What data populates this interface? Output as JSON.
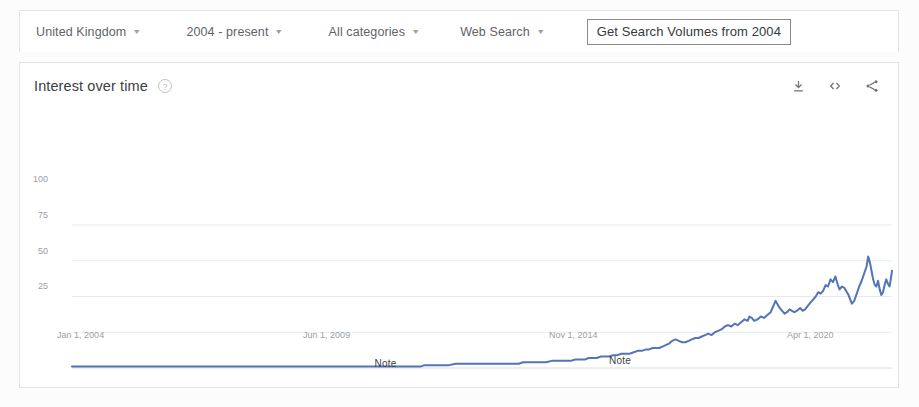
{
  "toolbar": {
    "filters": [
      {
        "label": "United Kingdom",
        "name": "region-selector"
      },
      {
        "label": "2004 - present",
        "name": "time-range-selector"
      },
      {
        "label": "All categories",
        "name": "category-selector"
      },
      {
        "label": "Web Search",
        "name": "search-type-selector"
      }
    ],
    "caret": "▾",
    "cta_label": "Get Search Volumes from 2004"
  },
  "card": {
    "title": "Interest over time",
    "help_glyph": "?",
    "actions": [
      {
        "name": "download-icon",
        "label": "Download"
      },
      {
        "name": "embed-code-icon",
        "label": "Embed"
      },
      {
        "name": "share-icon",
        "label": "Share"
      }
    ]
  },
  "annotations": [
    {
      "label": "Note",
      "x_pct": 38.6,
      "y_px": 249
    },
    {
      "label": "Note",
      "x_pct": 67.2,
      "y_px": 246
    }
  ],
  "colors": {
    "line": "#5374b6",
    "grid": "#e8eaed",
    "axis_text": "#9aa0a6",
    "card_border": "#e4e4e4"
  },
  "chart_data": {
    "type": "line",
    "title": "Interest over time",
    "xlabel": "",
    "ylabel": "",
    "ylim": [
      0,
      100
    ],
    "yticks": [
      100,
      75,
      50,
      25
    ],
    "grid": true,
    "legend": "none",
    "xtick_labels": [
      "Jan 1, 2004",
      "Jun 1, 2009",
      "Nov 1, 2014",
      "Apr 1, 2020"
    ],
    "xtick_pcts": [
      0.5,
      30.5,
      60.5,
      89.5
    ],
    "series": [
      {
        "name": "Interest over time",
        "color": "#5374b6",
        "points": [
          [
            0.0,
            1
          ],
          [
            1.2,
            1
          ],
          [
            2.5,
            1
          ],
          [
            3.8,
            1
          ],
          [
            5.0,
            1
          ],
          [
            6.3,
            1
          ],
          [
            7.5,
            1
          ],
          [
            8.8,
            1
          ],
          [
            10.0,
            1
          ],
          [
            11.3,
            1
          ],
          [
            12.5,
            1
          ],
          [
            13.8,
            1
          ],
          [
            15.0,
            1
          ],
          [
            16.3,
            1
          ],
          [
            17.5,
            1
          ],
          [
            18.8,
            1
          ],
          [
            20.0,
            1
          ],
          [
            21.3,
            1
          ],
          [
            22.5,
            1
          ],
          [
            23.8,
            1
          ],
          [
            25.0,
            1
          ],
          [
            26.3,
            1
          ],
          [
            27.5,
            1
          ],
          [
            28.8,
            1
          ],
          [
            30.0,
            1
          ],
          [
            31.3,
            1
          ],
          [
            32.5,
            1
          ],
          [
            33.8,
            1
          ],
          [
            35.0,
            1
          ],
          [
            36.3,
            1
          ],
          [
            37.5,
            1
          ],
          [
            38.8,
            1
          ],
          [
            40.0,
            1
          ],
          [
            41.3,
            1
          ],
          [
            42.5,
            1
          ],
          [
            43.0,
            2
          ],
          [
            44.0,
            2
          ],
          [
            45.0,
            2
          ],
          [
            46.0,
            2
          ],
          [
            46.8,
            3
          ],
          [
            47.5,
            3
          ],
          [
            48.5,
            3
          ],
          [
            49.5,
            3
          ],
          [
            50.5,
            3
          ],
          [
            51.5,
            3
          ],
          [
            52.5,
            3
          ],
          [
            53.5,
            3
          ],
          [
            54.5,
            3
          ],
          [
            55.0,
            4
          ],
          [
            55.8,
            4
          ],
          [
            56.5,
            4
          ],
          [
            57.2,
            4
          ],
          [
            57.8,
            4
          ],
          [
            58.5,
            5
          ],
          [
            59.0,
            5
          ],
          [
            59.6,
            5
          ],
          [
            60.2,
            5
          ],
          [
            60.8,
            5
          ],
          [
            61.4,
            6
          ],
          [
            62.0,
            6
          ],
          [
            62.6,
            6
          ],
          [
            63.0,
            7
          ],
          [
            63.5,
            7
          ],
          [
            64.0,
            7
          ],
          [
            64.5,
            8
          ],
          [
            65.0,
            8
          ],
          [
            65.5,
            8
          ],
          [
            66.0,
            9
          ],
          [
            66.5,
            9
          ],
          [
            67.0,
            10
          ],
          [
            67.5,
            10
          ],
          [
            68.0,
            10
          ],
          [
            68.5,
            11
          ],
          [
            69.0,
            12
          ],
          [
            69.5,
            12
          ],
          [
            70.0,
            13
          ],
          [
            70.4,
            13
          ],
          [
            70.8,
            14
          ],
          [
            71.2,
            14
          ],
          [
            71.6,
            14
          ],
          [
            72.0,
            15
          ],
          [
            72.4,
            16
          ],
          [
            72.8,
            17
          ],
          [
            73.2,
            19
          ],
          [
            73.6,
            20
          ],
          [
            74.0,
            19
          ],
          [
            74.4,
            18
          ],
          [
            74.8,
            18
          ],
          [
            75.2,
            19
          ],
          [
            75.6,
            20
          ],
          [
            76.0,
            21
          ],
          [
            76.4,
            21
          ],
          [
            76.8,
            22
          ],
          [
            77.2,
            23
          ],
          [
            77.6,
            24
          ],
          [
            78.0,
            23
          ],
          [
            78.4,
            25
          ],
          [
            78.8,
            26
          ],
          [
            79.2,
            27
          ],
          [
            79.6,
            29
          ],
          [
            80.0,
            30
          ],
          [
            80.4,
            29
          ],
          [
            80.8,
            31
          ],
          [
            81.2,
            30
          ],
          [
            81.6,
            32
          ],
          [
            82.0,
            34
          ],
          [
            82.4,
            33
          ],
          [
            82.6,
            36
          ],
          [
            82.9,
            35
          ],
          [
            83.2,
            33
          ],
          [
            83.6,
            34
          ],
          [
            84.0,
            36
          ],
          [
            84.4,
            35
          ],
          [
            84.8,
            37
          ],
          [
            85.2,
            39
          ],
          [
            85.5,
            43
          ],
          [
            85.8,
            47
          ],
          [
            86.0,
            45
          ],
          [
            86.3,
            42
          ],
          [
            86.6,
            40
          ],
          [
            86.9,
            38
          ],
          [
            87.2,
            39
          ],
          [
            87.5,
            41
          ],
          [
            87.8,
            40
          ],
          [
            88.1,
            39
          ],
          [
            88.4,
            40
          ],
          [
            88.8,
            42
          ],
          [
            89.1,
            40
          ],
          [
            89.4,
            41
          ],
          [
            89.8,
            44
          ],
          [
            90.1,
            46
          ],
          [
            90.4,
            48
          ],
          [
            90.7,
            50
          ],
          [
            91.0,
            53
          ],
          [
            91.3,
            52
          ],
          [
            91.6,
            54
          ],
          [
            91.9,
            58
          ],
          [
            92.2,
            57
          ],
          [
            92.5,
            62
          ],
          [
            92.8,
            60
          ],
          [
            93.1,
            64
          ],
          [
            93.4,
            58
          ],
          [
            93.6,
            55
          ],
          [
            93.9,
            57
          ],
          [
            94.2,
            56
          ],
          [
            94.5,
            53
          ],
          [
            94.7,
            51
          ],
          [
            94.9,
            48
          ],
          [
            95.1,
            45
          ],
          [
            95.4,
            47
          ],
          [
            95.7,
            52
          ],
          [
            96.0,
            57
          ],
          [
            96.3,
            61
          ],
          [
            96.6,
            66
          ],
          [
            96.9,
            71
          ],
          [
            97.1,
            78
          ],
          [
            97.3,
            74
          ],
          [
            97.5,
            68
          ],
          [
            97.7,
            62
          ],
          [
            97.9,
            58
          ],
          [
            98.1,
            57
          ],
          [
            98.3,
            61
          ],
          [
            98.5,
            55
          ],
          [
            98.7,
            51
          ],
          [
            98.9,
            53
          ],
          [
            99.1,
            58
          ],
          [
            99.3,
            62
          ],
          [
            99.5,
            59
          ],
          [
            99.7,
            57
          ],
          [
            99.85,
            62
          ],
          [
            100.0,
            68
          ]
        ]
      }
    ]
  }
}
